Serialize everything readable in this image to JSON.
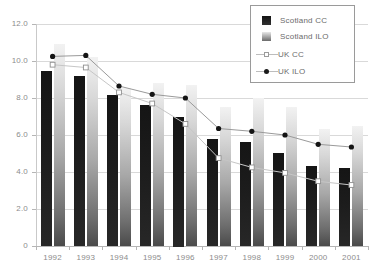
{
  "chart_data": {
    "type": "bar",
    "title": "",
    "subtitle": "",
    "xlabel": "",
    "ylabel": "",
    "categories": [
      "1992",
      "1993",
      "1994",
      "1995",
      "1996",
      "1997",
      "1998",
      "1999",
      "2000",
      "2001"
    ],
    "ylim": [
      0,
      12
    ],
    "ytick_labels": [
      "0",
      "2.0",
      "4.0",
      "6.0",
      "8.0",
      "10.0",
      "12.0"
    ],
    "ytick_values": [
      0,
      2,
      4,
      6,
      8,
      10,
      12
    ],
    "grid": true,
    "legend_position": "top-right",
    "series": [
      {
        "name": "Scotland CC",
        "render": "bar",
        "color": "#1c1c1c",
        "values": [
          9.45,
          9.2,
          8.15,
          7.6,
          7.0,
          5.8,
          5.6,
          5.05,
          4.35,
          4.2
        ]
      },
      {
        "name": "Scotland ILO",
        "render": "bar",
        "color": "#a8a8a8",
        "values": [
          10.9,
          10.2,
          8.55,
          8.8,
          8.7,
          7.5,
          8.0,
          7.5,
          6.3,
          6.5
        ]
      },
      {
        "name": "UK CC",
        "render": "line",
        "marker": "open-square",
        "color": "#bdbdbd",
        "values": [
          9.8,
          9.65,
          8.3,
          7.7,
          6.6,
          4.75,
          4.25,
          3.95,
          3.5,
          3.3
        ]
      },
      {
        "name": "UK ILO",
        "render": "line",
        "marker": "filled-circle",
        "color": "#1a1a1a",
        "values": [
          10.25,
          10.3,
          8.65,
          8.2,
          8.0,
          6.35,
          6.2,
          6.0,
          5.5,
          5.35
        ]
      }
    ]
  },
  "legend": {
    "items": [
      {
        "label": "Scotland CC",
        "icon": "black-square-swatch"
      },
      {
        "label": "Scotland ILO",
        "icon": "gray-gradient-square-swatch"
      },
      {
        "label": "UK CC",
        "icon": "line-open-square-marker"
      },
      {
        "label": "UK ILO",
        "icon": "line-filled-circle-marker"
      }
    ]
  },
  "colors": {
    "grid": "#d9d9d9",
    "axis": "#b5b5b5",
    "tick_text": "#8c8c8c",
    "legend_border": "#9a9a9a",
    "legend_text": "#6b6b6b",
    "series_cc": "#1c1c1c",
    "series_ilo": "#a8a8a8",
    "line_uk_cc": "#bdbdbd",
    "line_uk_ilo": "#1a1a1a"
  }
}
